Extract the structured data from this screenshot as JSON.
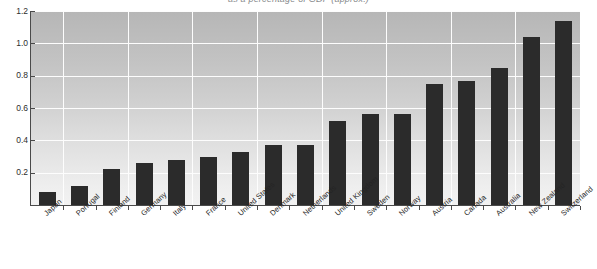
{
  "chart_data": {
    "type": "bar",
    "title": "as a percentage of GDP (approx.)",
    "xlabel": "",
    "ylabel": "",
    "ylim": [
      0,
      1.2
    ],
    "yticks": [
      "0.2",
      "0.4",
      "0.6",
      "0.8",
      "1.0",
      "1.2"
    ],
    "ytick_values": [
      0.2,
      0.4,
      0.6,
      0.8,
      1.0,
      1.2
    ],
    "grid": true,
    "legend": "none",
    "orientation": "vertical",
    "bar_color": "#2b2b2b",
    "plot_background_top": "#b6b6b6",
    "plot_background_bottom": "#f2f2f2",
    "gridline_color": "#fdfdfd",
    "axis_color": "#4a4a4a",
    "categories": [
      "Japan",
      "Portugal",
      "Finland",
      "Germany",
      "Italy",
      "France",
      "United States",
      "Denmark",
      "Netherlands",
      "United Kingdom",
      "Sweden",
      "Norway",
      "Austria",
      "Canada",
      "Australia",
      "New Zealand",
      "Switzerland"
    ],
    "values": [
      0.08,
      0.12,
      0.22,
      0.26,
      0.28,
      0.3,
      0.33,
      0.37,
      0.37,
      0.52,
      0.56,
      0.56,
      0.75,
      0.765,
      0.85,
      1.04,
      1.14
    ]
  }
}
